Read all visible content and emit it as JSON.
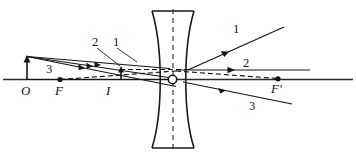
{
  "diagram": {
    "type": "optics-ray-diagram",
    "lens_type": "diverging-concave",
    "background_color": "#ffffff",
    "line_color": "#141414",
    "labels": {
      "object_point": "O",
      "focal_point_left": "F",
      "image_point": "I",
      "focal_point_right": "F'",
      "ray_1_left": "1",
      "ray_2_left": "2",
      "ray_3_left": "3",
      "ray_1_right": "1",
      "ray_2_right": "2",
      "ray_3_right": "3"
    },
    "elements": {
      "optical_axis": "horizontal-axis",
      "lens_axis": "vertical-dashed-axis",
      "optical_center": "O-center-circle",
      "object_arrow": "upright-object-arrow-at-O",
      "image_arrow": "small-upright-image-arrow-at-I",
      "virtual_rays": "dashed-backward-extensions"
    }
  }
}
